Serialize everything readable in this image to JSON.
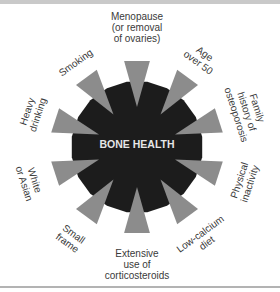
{
  "diagram": {
    "center_label": "BONE HEALTH",
    "colors": {
      "hub": "#1c1c1c",
      "spike": "#8c8c8c",
      "label": "#3a3a3a",
      "top_bar": "#c9c9c9",
      "bottom_rule": "#b3b3b3"
    },
    "risk_factors": [
      {
        "angle": 0,
        "lines": [
          "Menopause",
          "(or removal",
          "of ovaries)"
        ],
        "rotate": 0
      },
      {
        "angle": 36,
        "lines": [
          "Age",
          "over 50"
        ],
        "rotate": 36
      },
      {
        "angle": 72,
        "lines": [
          "Family",
          "history of",
          "osteoporosis"
        ],
        "rotate": 72
      },
      {
        "angle": 108,
        "lines": [
          "Physical",
          "inactivity"
        ],
        "rotate": -72
      },
      {
        "angle": 144,
        "lines": [
          "Low-calcium",
          "diet"
        ],
        "rotate": -36
      },
      {
        "angle": 180,
        "lines": [
          "Extensive",
          "use of",
          "corticosteroids"
        ],
        "rotate": 0
      },
      {
        "angle": 216,
        "lines": [
          "Small",
          "frame"
        ],
        "rotate": 36
      },
      {
        "angle": 252,
        "lines": [
          "White",
          "or Asian"
        ],
        "rotate": 72
      },
      {
        "angle": 288,
        "lines": [
          "Heavy",
          "drinking"
        ],
        "rotate": -72
      },
      {
        "angle": 324,
        "lines": [
          "Smoking"
        ],
        "rotate": -36
      }
    ]
  }
}
